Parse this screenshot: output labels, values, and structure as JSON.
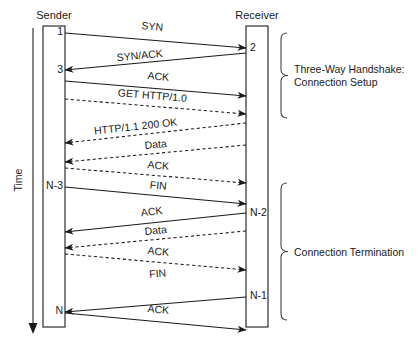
{
  "diagram": {
    "title_sender": "Sender",
    "title_receiver": "Receiver",
    "time_axis_label": "Time",
    "sender_sequence_labels": [
      {
        "text": "1",
        "y": 35
      },
      {
        "text": "3",
        "y": 73
      },
      {
        "text": "N-3",
        "y": 189
      },
      {
        "text": "N",
        "y": 314
      }
    ],
    "receiver_sequence_labels": [
      {
        "text": "2",
        "y": 51
      },
      {
        "text": "N-2",
        "y": 216
      },
      {
        "text": "N-1",
        "y": 299
      }
    ],
    "messages": [
      {
        "label": "SYN",
        "dir": "right",
        "style": "solid",
        "y1": 33,
        "y2": 48,
        "tx": 152,
        "ty": 30
      },
      {
        "label": "SYN/ACK",
        "dir": "left",
        "style": "solid",
        "y1": 53,
        "y2": 70,
        "tx": 140,
        "ty": 59
      },
      {
        "label": "ACK",
        "dir": "right",
        "style": "solid",
        "y1": 81,
        "y2": 96,
        "tx": 158,
        "ty": 80
      },
      {
        "label": "GET HTTP/1.0",
        "dir": "right",
        "style": "dashed",
        "y1": 99,
        "y2": 114,
        "tx": 152,
        "ty": 99
      },
      {
        "label": "HTTP/1.1 200 OK",
        "dir": "left",
        "style": "dashed",
        "y1": 123,
        "y2": 143,
        "tx": 136,
        "ty": 130
      },
      {
        "label": "Data",
        "dir": "left",
        "style": "dashed",
        "y1": 145,
        "y2": 162,
        "tx": 156,
        "ty": 148
      },
      {
        "label": "ACK",
        "dir": "right",
        "style": "dashed",
        "y1": 168,
        "y2": 183,
        "tx": 158,
        "ty": 169
      },
      {
        "label": "FIN",
        "dir": "right",
        "style": "solid",
        "y1": 187,
        "y2": 204,
        "tx": 158,
        "ty": 189
      },
      {
        "label": "ACK",
        "dir": "left",
        "style": "solid",
        "y1": 213,
        "y2": 232,
        "tx": 152,
        "ty": 215
      },
      {
        "label": "Data",
        "dir": "left",
        "style": "dashed",
        "y1": 231,
        "y2": 248,
        "tx": 156,
        "ty": 234
      },
      {
        "label": "ACK",
        "dir": "right",
        "style": "dashed",
        "y1": 254,
        "y2": 270,
        "tx": 158,
        "ty": 255
      },
      {
        "label": "FIN",
        "dir": "left",
        "style": "solid",
        "y1": 297,
        "y2": 312,
        "tx": 158,
        "ty": 277
      },
      {
        "label": "ACK",
        "dir": "right",
        "style": "solid",
        "y1": 313,
        "y2": 330,
        "tx": 158,
        "ty": 313
      }
    ],
    "groups": [
      {
        "lines": [
          "Three-Way Handshake:",
          "Connection Setup"
        ],
        "brace_top": 33,
        "brace_bottom": 118
      },
      {
        "lines": [
          "Connection Termination"
        ],
        "brace_top": 183,
        "brace_bottom": 320
      }
    ]
  }
}
